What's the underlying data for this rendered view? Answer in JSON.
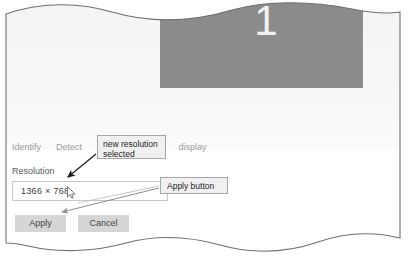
{
  "figure": {
    "kind": "annotated-screenshot",
    "page_edge": "torn-wavy"
  },
  "display_preview": {
    "monitor_label": "1",
    "monitor_color": "#8b8b8b",
    "number_color": "#f1f1f1"
  },
  "links": [
    {
      "label": "Identify",
      "name": "identify-link"
    },
    {
      "label": "Detect",
      "name": "detect-link"
    },
    {
      "label": "C",
      "name": "connect-link-truncated"
    },
    {
      "label": "display",
      "name": "wireless-display-link-truncated"
    }
  ],
  "resolution_section": {
    "label": "Resolution",
    "selected_value": "1366 × 768"
  },
  "buttons": {
    "apply": "Apply",
    "cancel": "Cancel"
  },
  "annotations": [
    {
      "name": "callout-new-resolution-selected",
      "line1": "new resolution",
      "line2": "selected"
    },
    {
      "name": "callout-apply-button",
      "text": "Apply button"
    }
  ],
  "colors": {
    "paper": "#ffffff",
    "panel_tint": "#f5f5f5",
    "monitor": "#8b8b8b",
    "link_text": "#9a9a9a",
    "button_face": "#d6d6d6",
    "callout_fill": "#f0f0f0",
    "callout_border": "#a6a6a6",
    "combo_border": "#c8c8c8",
    "arrow_dark": "#1a1a1a",
    "arrow_light": "#8d8d8d"
  }
}
